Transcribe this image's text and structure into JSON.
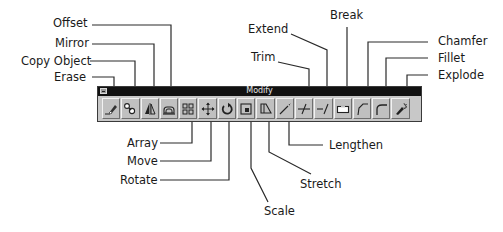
{
  "toolbar": {
    "title": "Modify",
    "buttons": [
      {
        "id": "erase",
        "label": "Erase",
        "icon": "eraser-icon"
      },
      {
        "id": "copy-object",
        "label": "Copy Object",
        "icon": "copy-object-icon"
      },
      {
        "id": "mirror",
        "label": "Mirror",
        "icon": "mirror-icon"
      },
      {
        "id": "offset",
        "label": "Offset",
        "icon": "offset-icon"
      },
      {
        "id": "array",
        "label": "Array",
        "icon": "array-icon"
      },
      {
        "id": "move",
        "label": "Move",
        "icon": "move-icon"
      },
      {
        "id": "rotate",
        "label": "Rotate",
        "icon": "rotate-icon"
      },
      {
        "id": "scale",
        "label": "Scale",
        "icon": "scale-icon"
      },
      {
        "id": "stretch",
        "label": "Stretch",
        "icon": "stretch-icon"
      },
      {
        "id": "lengthen",
        "label": "Lengthen",
        "icon": "lengthen-icon"
      },
      {
        "id": "trim",
        "label": "Trim",
        "icon": "trim-icon"
      },
      {
        "id": "extend",
        "label": "Extend",
        "icon": "extend-icon"
      },
      {
        "id": "break",
        "label": "Break",
        "icon": "break-icon"
      },
      {
        "id": "chamfer",
        "label": "Chamfer",
        "icon": "chamfer-icon"
      },
      {
        "id": "fillet",
        "label": "Fillet",
        "icon": "fillet-icon"
      },
      {
        "id": "explode",
        "label": "Explode",
        "icon": "explode-icon"
      }
    ]
  },
  "callouts": {
    "offset": "Offset",
    "mirror": "Mirror",
    "copy_object": "Copy Object",
    "erase": "Erase",
    "array": "Array",
    "move": "Move",
    "rotate": "Rotate",
    "scale": "Scale",
    "stretch": "Stretch",
    "lengthen": "Lengthen",
    "trim": "Trim",
    "extend": "Extend",
    "break": "Break",
    "chamfer": "Chamfer",
    "fillet": "Fillet",
    "explode": "Explode"
  },
  "colors": {
    "titlebar": "#111111",
    "toolbar_face": "#c0c0c0",
    "leader": "#2a2a2a"
  }
}
